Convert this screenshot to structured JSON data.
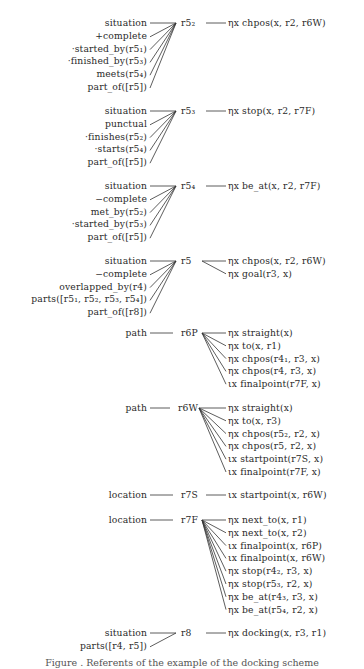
{
  "figure": {
    "nodes": [
      {
        "id": "r5_2",
        "label": "r5₂",
        "y": 23,
        "left": [
          "situation",
          "+complete",
          "·started_by(r5₁)",
          "·finished_by(r5₃)",
          "meets(r5₄)",
          "part_of([r5])"
        ],
        "right": [
          "ηx chpos(x, r2, r6W)"
        ]
      },
      {
        "id": "r5_3",
        "label": "r5₃",
        "y": 111,
        "left": [
          "situation",
          "punctual",
          "·finishes(r5₂)",
          "·starts(r5₄)",
          "part_of([r5])"
        ],
        "right": [
          "ηx stop(x, r2, r7F)"
        ]
      },
      {
        "id": "r5_4",
        "label": "r5₄",
        "y": 186,
        "left": [
          "situation",
          "−complete",
          "met_by(r5₂)",
          "·started_by(r5₃)",
          "part_of([r5])"
        ],
        "right": [
          "ηx be_at(x, r2, r7F)"
        ]
      },
      {
        "id": "r5",
        "label": "r5",
        "y": 261,
        "left": [
          "situation",
          "−complete",
          "overlapped_by(r4)",
          "parts([r5₁, r5₂, r5₃, r5₄])",
          "part_of([r8])"
        ],
        "right": [
          "ηx chpos(x, r2, r6W)",
          "ηx goal(r3, x)"
        ]
      },
      {
        "id": "r6_P",
        "label": "r6P",
        "y": 333,
        "left": [
          "path"
        ],
        "right": [
          "ηx straight(x)",
          "ηx to(x, r1)",
          "ηx chpos(r4₁, r3, x)",
          "ηx chpos(r4, r3, x)",
          "ιx finalpoint(r7F, x)"
        ]
      },
      {
        "id": "r6_W",
        "label": "r6W",
        "y": 408,
        "left": [
          "path"
        ],
        "right": [
          "ηx straight(x)",
          "ηx to(x, r3)",
          "ηx chpos(r5₂, r2, x)",
          "ηx chpos(r5, r2, x)",
          "ιx startpoint(r7S, x)",
          "ιx finalpoint(r7F, x)"
        ]
      },
      {
        "id": "r7_S",
        "label": "r7S",
        "y": 495,
        "left": [
          "location"
        ],
        "right": [
          "ιx startpoint(x, r6W)"
        ]
      },
      {
        "id": "r7_F",
        "label": "r7F",
        "y": 520,
        "left": [
          "location"
        ],
        "right": [
          "ηx next_to(x, r1)",
          "ηx next_to(x, r2)",
          "ιx finalpoint(x, r6P)",
          "ιx finalpoint(x, r6W)",
          "ηx stop(r4₂, r3, x)",
          "ηx stop(r5₃, r2, x)",
          "ηx be_at(r4₃, r3, x)",
          "ηx be_at(r5₄, r2, x)"
        ]
      },
      {
        "id": "r8",
        "label": "r8",
        "y": 633,
        "left": [
          "situation",
          "parts([r4, r5])"
        ],
        "right": [
          "ηx docking(x, r3, r1)"
        ]
      }
    ],
    "caption": "Figure . Referents of the example of the docking scheme"
  }
}
